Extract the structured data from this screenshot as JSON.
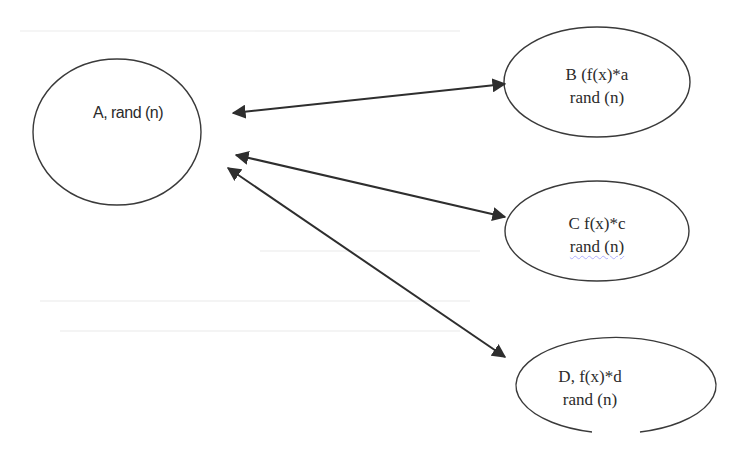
{
  "diagram": {
    "type": "node-link",
    "stroke_color": "#3a3a3a",
    "background": "#ffffff",
    "nodes": [
      {
        "id": "A",
        "shape": "ellipse",
        "center": [
          117,
          132
        ],
        "radius": [
          84,
          73
        ],
        "lines": [
          "A, rand (n)"
        ]
      },
      {
        "id": "B",
        "shape": "ellipse",
        "center": [
          557,
          82
        ],
        "radius": [
          87,
          55
        ],
        "lines": [
          "B (f(x)*a",
          "rand (n)"
        ]
      },
      {
        "id": "C",
        "shape": "ellipse",
        "center": [
          577,
          231
        ],
        "radius": [
          75,
          48
        ],
        "lines": [
          "C f(x)*c",
          "rand (n)"
        ]
      },
      {
        "id": "D",
        "shape": "ellipse",
        "center": [
          558,
          382
        ],
        "radius": [
          100,
          48
        ],
        "lines": [
          "D, f(x)*d",
          "rand (n)"
        ]
      }
    ],
    "edges": [
      {
        "from": "A",
        "to": "B",
        "direction": "bidirectional",
        "start": [
          233,
          113
        ],
        "end": [
          505,
          84
        ]
      },
      {
        "from": "A",
        "to": "C",
        "direction": "bidirectional",
        "start": [
          236,
          155
        ],
        "end": [
          505,
          217
        ]
      },
      {
        "from": "A",
        "to": "D",
        "direction": "bidirectional",
        "start": [
          228,
          168
        ],
        "end": [
          505,
          357
        ]
      }
    ]
  },
  "labels": {
    "a_line1": "A, rand (n)",
    "b_line1": "B (f(x)*a",
    "b_line2": "rand (n)",
    "c_line1": "C f(x)*c",
    "c_line2": "rand (n)",
    "d_line1": "D, f(x)*d",
    "d_line2": "rand (n)"
  }
}
